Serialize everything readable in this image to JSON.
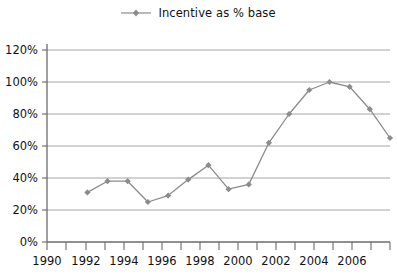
{
  "legend": {
    "entries": [
      {
        "label": "Incentive as % base",
        "color": "#8c8c8c",
        "marker": "diamond"
      }
    ],
    "position": "top-center"
  },
  "axes": {
    "y_ticks": [
      "0%",
      "20%",
      "40%",
      "60%",
      "80%",
      "100%",
      "120%"
    ],
    "x_ticks": [
      "1990",
      "1992",
      "1994",
      "1996",
      "1998",
      "2000",
      "2002",
      "2004",
      "2006"
    ]
  },
  "colors": {
    "series": "#8c8c8c",
    "gridline": "#9a9a9a",
    "axis": "#6b6b6b",
    "text": "#111111",
    "background": "#ffffff"
  },
  "chart_data": {
    "type": "line",
    "title": "",
    "subtitle": "",
    "xlabel": "",
    "ylabel": "",
    "xlim": [
      1990,
      2007
    ],
    "ylim": [
      0,
      120
    ],
    "y_unit": "%",
    "y_tick_step": 20,
    "x_tick_step": 1,
    "x_label_step": 2,
    "grid": true,
    "legend_position": "top-center",
    "x": [
      1992,
      1993,
      1994,
      1995,
      1996,
      1997,
      1998,
      1999,
      2000,
      2001,
      2002,
      2003,
      2004,
      2005,
      2006,
      2007
    ],
    "series": [
      {
        "name": "Incentive as % base",
        "color": "#8c8c8c",
        "marker": "diamond",
        "values": [
          31,
          38,
          38,
          25,
          29,
          39,
          48,
          33,
          36,
          62,
          80,
          95,
          100,
          97,
          83,
          65
        ]
      }
    ]
  }
}
